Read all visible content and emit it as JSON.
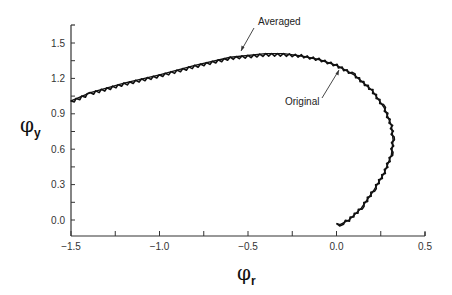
{
  "chart_data": {
    "type": "line",
    "title": "",
    "xlabel": "φr",
    "ylabel": "φy",
    "xlim": [
      -1.5,
      0.5
    ],
    "ylim": [
      -0.13,
      1.65
    ],
    "grid": false,
    "x_ticks": [
      "-1.5",
      "-1.0",
      "-0.5",
      "0.0",
      "0.5"
    ],
    "y_ticks": [
      "0.0",
      "0.3",
      "0.6",
      "0.9",
      "1.2",
      "1.5"
    ],
    "annotations": [
      {
        "text": "Averaged",
        "points_to": [
          -0.55,
          1.39
        ]
      },
      {
        "text": "Original",
        "points_to": [
          0.0,
          1.31
        ]
      }
    ],
    "series": [
      {
        "name": "Original",
        "style": "jagged",
        "x": [
          -1.5,
          -1.39,
          -1.2,
          -1.0,
          -0.8,
          -0.6,
          -0.4,
          -0.3,
          -0.2,
          -0.1,
          0.0,
          0.1,
          0.2,
          0.27,
          0.31,
          0.32,
          0.31,
          0.27,
          0.21,
          0.14,
          0.07,
          0.02,
          0.0
        ],
        "y": [
          1.0,
          1.07,
          1.15,
          1.22,
          1.3,
          1.37,
          1.4,
          1.4,
          1.39,
          1.36,
          1.31,
          1.23,
          1.1,
          0.95,
          0.8,
          0.68,
          0.55,
          0.4,
          0.25,
          0.1,
          0.0,
          -0.04,
          -0.03
        ]
      },
      {
        "name": "Averaged",
        "style": "smooth",
        "x": [
          -1.5,
          -1.39,
          -1.2,
          -1.0,
          -0.8,
          -0.6,
          -0.4,
          -0.3,
          -0.2,
          -0.1,
          0.0,
          0.1,
          0.2,
          0.27,
          0.31,
          0.32,
          0.31,
          0.27,
          0.21,
          0.14,
          0.07,
          0.02,
          0.0
        ],
        "y": [
          1.01,
          1.08,
          1.16,
          1.23,
          1.31,
          1.38,
          1.41,
          1.41,
          1.39,
          1.36,
          1.31,
          1.23,
          1.1,
          0.95,
          0.8,
          0.68,
          0.55,
          0.4,
          0.25,
          0.1,
          0.0,
          -0.04,
          -0.03
        ]
      }
    ]
  },
  "labels": {
    "x_axis_symbol": "φ",
    "x_axis_sub": "r",
    "y_axis_symbol": "φ",
    "y_axis_sub": "y",
    "averaged": "Averaged",
    "original": "Original"
  },
  "colors": {
    "line": "#111111",
    "axis": "#333333"
  }
}
